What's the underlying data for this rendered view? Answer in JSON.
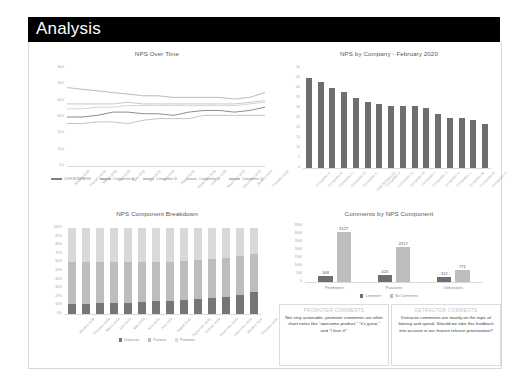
{
  "header": {
    "title": "Analysis"
  },
  "chart_data": [
    {
      "id": "nps_over_time",
      "type": "line",
      "title": "NPS Over Time",
      "xlabel": "",
      "ylabel": "",
      "ylim": [
        0,
        60
      ],
      "yticks": [
        "60.0",
        "50.0",
        "40.0",
        "30.0",
        "20.0",
        "10.0",
        "0.0"
      ],
      "grid": false,
      "legend_position": "bottom",
      "categories": [
        "January 2019",
        "February 2019",
        "March 2019",
        "April 2019",
        "May 2019",
        "June 2019",
        "July 2019",
        "August 2019",
        "September 2019",
        "October 2019",
        "November 2019",
        "December 2019",
        "January 2020",
        "February 2020"
      ],
      "series": [
        {
          "name": "OUR BUSINESS",
          "color": "#808080",
          "values": [
            30,
            30,
            31,
            33,
            33,
            32,
            32,
            31,
            33,
            34,
            34,
            33,
            34,
            36
          ]
        },
        {
          "name": "Competitor A",
          "color": "#b3b3b3",
          "values": [
            48,
            47,
            46,
            45,
            44,
            43,
            43,
            42,
            42,
            42,
            42,
            41,
            42,
            45
          ]
        },
        {
          "name": "Competitor B",
          "color": "#c4c4c4",
          "values": [
            38,
            38,
            38,
            38,
            39,
            38,
            38,
            38,
            38,
            38,
            38,
            38,
            39,
            40
          ]
        },
        {
          "name": "Competitor C",
          "color": "#d0d0d0",
          "values": [
            35,
            35,
            36,
            36,
            37,
            37,
            37,
            37,
            37,
            37,
            37,
            37,
            38,
            39
          ]
        },
        {
          "name": "Competitor D",
          "color": "#bdbdbd",
          "values": [
            26,
            26,
            27,
            27,
            26,
            28,
            29,
            29,
            29,
            31,
            31,
            31,
            31,
            31
          ]
        }
      ]
    },
    {
      "id": "nps_by_company",
      "type": "bar",
      "title": "NPS by Company - February 2020",
      "xlabel": "",
      "ylabel": "",
      "ylim": [
        0,
        50
      ],
      "yticks": [
        "50",
        "45",
        "40",
        "35",
        "30",
        "25",
        "20",
        "15",
        "10",
        "5",
        "0"
      ],
      "bar_color": "#6e6e6e",
      "categories": [
        "Competitor A",
        "Competitor B",
        "Competitor C",
        "Competitor D",
        "Competitor E",
        "OUR BUSINESS",
        "Competitor F",
        "Competitor G",
        "Competitor H",
        "Competitor I",
        "Competitor J",
        "Competitor K",
        "Competitor L",
        "Competitor M",
        "Competitor N",
        "Competitor O"
      ],
      "values": [
        45,
        43,
        40,
        38,
        35,
        33,
        32,
        31,
        31,
        31,
        30,
        27,
        25,
        25,
        24,
        22
      ]
    },
    {
      "id": "nps_component_breakdown",
      "type": "bar",
      "stacked": true,
      "title": "NPS Component Breakdown",
      "xlabel": "",
      "ylabel": "",
      "ylim": [
        0,
        100
      ],
      "yticks": [
        "100%",
        "90%",
        "80%",
        "70%",
        "60%",
        "50%",
        "40%",
        "30%",
        "20%",
        "10%",
        "0%"
      ],
      "legend_position": "bottom",
      "categories": [
        "January 2019",
        "February 2019",
        "March 2019",
        "April 2019",
        "May 2019",
        "June 2019",
        "July 2019",
        "August 2019",
        "September 2019",
        "October 2019",
        "November 2019",
        "December 2019",
        "January 2020",
        "February 2020"
      ],
      "series": [
        {
          "name": "Detractor",
          "color": "#767676",
          "values": [
            12,
            12,
            13,
            13,
            13,
            14,
            15,
            15,
            16,
            17,
            19,
            20,
            22,
            26
          ]
        },
        {
          "name": "Passive",
          "color": "#bdbdbd",
          "values": [
            48,
            48,
            48,
            48,
            48,
            47,
            46,
            46,
            46,
            46,
            45,
            45,
            45,
            44
          ]
        },
        {
          "name": "Promoter",
          "color": "#d9d9d9",
          "values": [
            40,
            40,
            39,
            39,
            39,
            39,
            39,
            39,
            38,
            37,
            36,
            35,
            33,
            30
          ]
        }
      ]
    },
    {
      "id": "comments_by_nps_component",
      "type": "bar",
      "grouped": true,
      "title": "Comments by NPS Component",
      "xlabel": "",
      "ylabel": "",
      "ylim": [
        0,
        3500
      ],
      "yticks": [
        "3500",
        "3000",
        "2500",
        "2000",
        "1500",
        "1000",
        "500",
        "0"
      ],
      "legend_position": "bottom",
      "categories": [
        "Promoters",
        "Passives",
        "Detractors"
      ],
      "series": [
        {
          "name": "Comment",
          "color": "#6e6e6e",
          "values": [
            348,
            420,
            312
          ]
        },
        {
          "name": "No Comments",
          "color": "#bdbdbd",
          "values": [
            3127,
            2217,
            771
          ]
        }
      ]
    }
  ],
  "comment_boxes": [
    {
      "heading": "PROMOTER COMMENTS",
      "body": "Not very actionable, promoter comments are often short notes like \"awesome product,\" \"it's great,\" and \"I love it!\""
    },
    {
      "heading": "DETRACTOR COMMENTS",
      "body": "Detractor comments are mainly on the topic of latency and speed. Should we take this feedback into account in our feature release prioritization?"
    }
  ]
}
